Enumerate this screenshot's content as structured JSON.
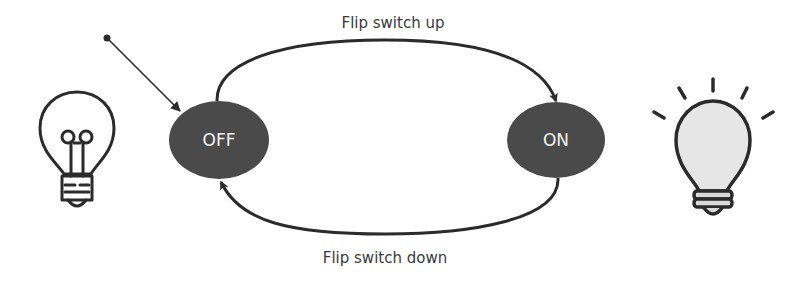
{
  "diagram": {
    "type": "state-machine",
    "states": [
      {
        "id": "off",
        "label": "OFF",
        "initial": true
      },
      {
        "id": "on",
        "label": "ON",
        "initial": false
      }
    ],
    "transitions": [
      {
        "from": "off",
        "to": "on",
        "label": "Flip switch up"
      },
      {
        "from": "on",
        "to": "off",
        "label": "Flip switch down"
      }
    ],
    "icons": {
      "left": "lightbulb-off-icon",
      "right": "lightbulb-on-icon"
    },
    "colors": {
      "state_fill": "#4a4a4a",
      "state_text": "#f2f2f2",
      "stroke": "#2b2b2b",
      "bulb_on_fill": "#e6e6e6",
      "background": "#ffffff"
    }
  }
}
